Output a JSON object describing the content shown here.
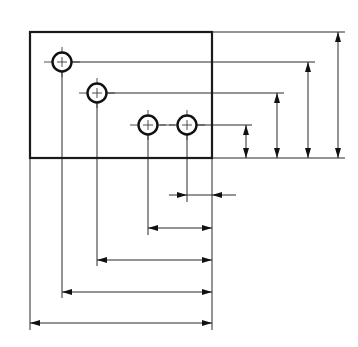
{
  "diagram": {
    "title": "",
    "type": "technical-drawing",
    "datum_edges": [
      "left-edge",
      "bottom-edge"
    ],
    "colors": {
      "line": "#1a1a1a",
      "background": "#ffffff"
    },
    "plate": {
      "name": "rectangular-plate",
      "width_units": 182,
      "height_units": 126
    },
    "holes": [
      {
        "name": "hole-1",
        "x": 32,
        "y": 96
      },
      {
        "name": "hole-2",
        "x": 67,
        "y": 65
      },
      {
        "name": "hole-3",
        "x": 118,
        "y": 33
      },
      {
        "name": "hole-4",
        "x": 157,
        "y": 33
      }
    ],
    "vertical_dimensions": [
      {
        "name": "dim-v-hole-3-4",
        "from": "bottom-edge",
        "to": "hole-3-4-centerline"
      },
      {
        "name": "dim-v-hole-2",
        "from": "bottom-edge",
        "to": "hole-2-centerline"
      },
      {
        "name": "dim-v-hole-1",
        "from": "bottom-edge",
        "to": "hole-1-centerline"
      },
      {
        "name": "dim-v-overall",
        "from": "bottom-edge",
        "to": "top-edge"
      }
    ],
    "horizontal_dimensions": [
      {
        "name": "dim-h-hole-4",
        "from": "hole-4-centerline",
        "to": "right-edge",
        "style": "outside-arrows"
      },
      {
        "name": "dim-h-hole-3",
        "from": "hole-3-centerline",
        "to": "right-edge"
      },
      {
        "name": "dim-h-hole-2",
        "from": "hole-2-centerline",
        "to": "right-edge"
      },
      {
        "name": "dim-h-hole-1",
        "from": "hole-1-centerline",
        "to": "right-edge"
      },
      {
        "name": "dim-h-overall",
        "from": "left-edge",
        "to": "right-edge"
      }
    ],
    "labels": []
  }
}
